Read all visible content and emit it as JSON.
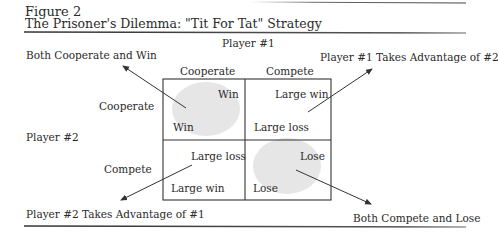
{
  "figure": {
    "number": "Figure 2",
    "title": "The Prisoner's Dilemma: \"Tit For Tat\" Strategy"
  },
  "players": {
    "player1": "Player #1",
    "player2": "Player #2"
  },
  "columns": [
    "Cooperate",
    "Compete"
  ],
  "rows": [
    "Cooperate",
    "Compete"
  ],
  "cells": {
    "coop_coop": {
      "player1": "Win",
      "player2": "Win"
    },
    "coop_compete": {
      "player1": "Large win",
      "player2": "Large loss"
    },
    "compete_coop": {
      "player1": "Large loss",
      "player2": "Large win"
    },
    "compete_compete": {
      "player1": "Lose",
      "player2": "Lose"
    }
  },
  "outcomes": {
    "top_left": "Both Cooperate and Win",
    "top_right": "Player #1 Takes Advantage of #2",
    "bottom_left": "Player #2 Takes Advantage of #1",
    "bottom_right": "Both Compete and Lose"
  },
  "colors": {
    "text": "#2a2a2a",
    "grid": "#333333",
    "highlight": "#e6e6e6",
    "rule": "#444444"
  }
}
